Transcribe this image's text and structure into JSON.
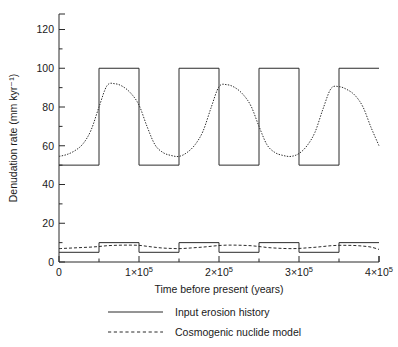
{
  "figure": {
    "background": "#ffffff",
    "line_color": "#2b2b2b"
  },
  "axes": {
    "y_title": "Denudation rate (mm kyr⁻¹)",
    "x_title": "Time before present (years)",
    "y_ticks": [
      "0",
      "20",
      "40",
      "60",
      "80",
      "100",
      "120"
    ],
    "y_tick_values": [
      0,
      20,
      40,
      60,
      80,
      100,
      120
    ],
    "y_minor_values": [
      10,
      30,
      50,
      70,
      90,
      110
    ],
    "x_tick_labels": [
      "0",
      "1×10⁵",
      "2×10⁵",
      "3×10⁵",
      "4×10⁵"
    ],
    "x_tick_mantissa": [
      "0",
      "1×10",
      "2×10",
      "3×10",
      "4×10"
    ],
    "x_tick_exponent": [
      "",
      "5",
      "5",
      "5",
      "5"
    ],
    "x_tick_values": [
      0,
      100000,
      200000,
      300000,
      400000
    ],
    "x_minor_values": [
      50000,
      150000,
      250000,
      350000
    ]
  },
  "legend": {
    "position": "below-axis",
    "items": [
      {
        "label": "Input erosion history",
        "style": "solid"
      },
      {
        "label": "Cosmogenic nuclide model",
        "style": "dashed"
      }
    ]
  },
  "chart_data": {
    "type": "line",
    "title": "",
    "xlabel": "Time before present (years)",
    "ylabel": "Denudation rate (mm kyr⁻¹)",
    "xlim": [
      0,
      400000
    ],
    "ylim": [
      0,
      128
    ],
    "grid": false,
    "legend_position": "below",
    "series": [
      {
        "name": "Input erosion history",
        "style": "solid",
        "description": "High-amplitude square wave alternating between 50 and 100 mm/kyr with a 10^5 yr period (50 kyr half-period), starting low.",
        "square_wave": {
          "low": 50,
          "high": 100,
          "period": 100000,
          "start_phase": "low"
        },
        "x": [
          0,
          50000,
          50000,
          100000,
          100000,
          150000,
          150000,
          200000,
          200000,
          250000,
          250000,
          300000,
          300000,
          350000,
          350000,
          400000
        ],
        "values": [
          50,
          50,
          100,
          100,
          50,
          50,
          100,
          100,
          50,
          50,
          100,
          100,
          50,
          50,
          100,
          100
        ]
      },
      {
        "name": "Cosmogenic nuclide model",
        "style": "dashed",
        "description": "Lagged exponential response to the high-amplitude square wave; rises toward ~92 during high phases and relaxes toward ~54 during low phases.",
        "x": [
          0,
          10000,
          20000,
          30000,
          40000,
          50000,
          60000,
          70000,
          80000,
          90000,
          100000,
          110000,
          120000,
          130000,
          140000,
          150000,
          160000,
          170000,
          180000,
          190000,
          200000,
          210000,
          220000,
          230000,
          240000,
          250000,
          260000,
          270000,
          280000,
          290000,
          300000,
          310000,
          320000,
          330000,
          340000,
          350000,
          360000,
          370000,
          380000,
          390000,
          400000
        ],
        "values": [
          54.5,
          55.5,
          57.5,
          61.0,
          68.0,
          80.0,
          91.0,
          92.0,
          90.5,
          87.0,
          81.0,
          70.0,
          60.5,
          56.5,
          55.0,
          54.5,
          56.5,
          60.5,
          67.5,
          79.5,
          90.5,
          91.5,
          90.0,
          86.5,
          80.5,
          70.0,
          60.5,
          56.5,
          55.0,
          54.5,
          56.0,
          60.0,
          67.0,
          79.0,
          89.5,
          90.5,
          89.0,
          86.0,
          80.0,
          69.5,
          60.0
        ]
      },
      {
        "name": "Input erosion history (low amplitude)",
        "style": "solid",
        "description": "Low-amplitude square wave alternating between 5 and 10 mm/kyr with the same 10^5 yr period.",
        "square_wave": {
          "low": 5,
          "high": 10,
          "period": 100000,
          "start_phase": "low"
        },
        "x": [
          0,
          50000,
          50000,
          100000,
          100000,
          150000,
          150000,
          200000,
          200000,
          250000,
          250000,
          300000,
          300000,
          350000,
          350000,
          400000
        ],
        "values": [
          5,
          5,
          10,
          10,
          5,
          5,
          10,
          10,
          5,
          5,
          10,
          10,
          5,
          5,
          10,
          10
        ]
      },
      {
        "name": "Cosmogenic nuclide model (low amplitude)",
        "style": "dashed",
        "description": "Lagged, strongly damped response to the low-amplitude square wave, oscillating roughly between 6.2 and 8.8 mm/kyr.",
        "x": [
          0,
          10000,
          20000,
          30000,
          40000,
          50000,
          60000,
          70000,
          80000,
          90000,
          100000,
          110000,
          120000,
          130000,
          140000,
          150000,
          160000,
          170000,
          180000,
          190000,
          200000,
          210000,
          220000,
          230000,
          240000,
          250000,
          260000,
          270000,
          280000,
          290000,
          300000,
          310000,
          320000,
          330000,
          340000,
          350000,
          360000,
          370000,
          380000,
          390000,
          400000
        ],
        "values": [
          6.9,
          7.1,
          7.3,
          7.5,
          7.7,
          8.0,
          8.4,
          8.6,
          8.7,
          8.7,
          8.6,
          8.1,
          7.6,
          7.2,
          7.0,
          6.9,
          7.1,
          7.4,
          7.7,
          8.1,
          8.5,
          8.7,
          8.7,
          8.6,
          8.4,
          8.0,
          7.5,
          7.2,
          7.0,
          6.9,
          7.0,
          7.3,
          7.6,
          8.0,
          8.4,
          8.6,
          8.6,
          8.5,
          8.2,
          7.7,
          6.5
        ]
      }
    ]
  }
}
